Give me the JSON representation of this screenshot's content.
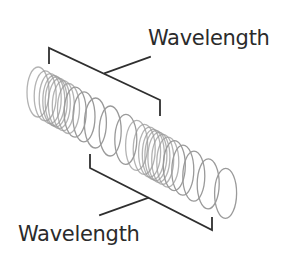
{
  "diagram": {
    "labels": {
      "top": "Wavelength",
      "bottom": "Wavelength"
    },
    "colors": {
      "coil": "#9a9a9a",
      "bracket": "#2f2f2f",
      "text": "#2b2b2b",
      "background": "#ffffff"
    }
  }
}
